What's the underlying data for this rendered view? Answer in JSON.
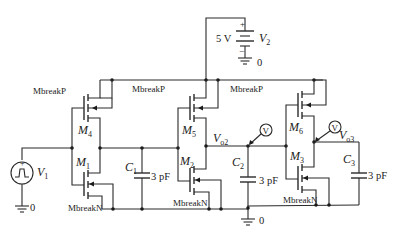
{
  "diagram": {
    "type": "circuit-schematic"
  },
  "sources": {
    "v2": {
      "name": "V",
      "sub": "2",
      "value": "5 V",
      "plus": "+",
      "minus": "−",
      "ground": "0"
    },
    "v1": {
      "name": "V",
      "sub": "1",
      "ground": "0",
      "icon": "pulse-source"
    }
  },
  "transistors": {
    "m4": {
      "name": "M",
      "sub": "4",
      "model": "MbreakP"
    },
    "m5": {
      "name": "M",
      "sub": "5",
      "model": "MbreakP"
    },
    "m6": {
      "name": "M",
      "sub": "6",
      "model": "MbreakP"
    },
    "m1": {
      "name": "M",
      "sub": "1",
      "model": "MbreakN"
    },
    "m2": {
      "name": "M",
      "sub": "2",
      "model": "MbreakN"
    },
    "m3": {
      "name": "M",
      "sub": "3",
      "model": "MbreakN"
    }
  },
  "capacitors": {
    "c1": {
      "name": "C",
      "sub": "1",
      "value": "3 pF"
    },
    "c2": {
      "name": "C",
      "sub": "2",
      "value": "3 pF"
    },
    "c3": {
      "name": "C",
      "sub": "3",
      "value": "3 pF"
    }
  },
  "nodes": {
    "vo2": {
      "name": "V",
      "sub": "o2"
    },
    "vo3": {
      "name": "V",
      "sub": "o3"
    }
  },
  "probes": {
    "p1": {
      "label": "V"
    },
    "p2": {
      "label": "V"
    }
  },
  "ground": {
    "label": "0"
  }
}
